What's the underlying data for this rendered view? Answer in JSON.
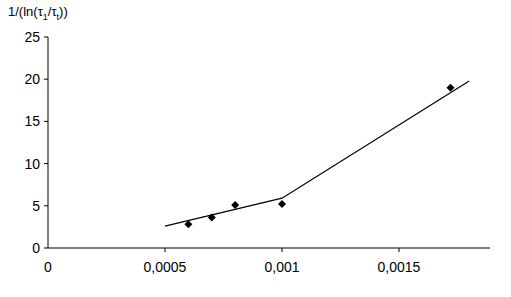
{
  "chart_data": {
    "type": "scatter",
    "title": "",
    "xlabel": "",
    "ylabel": "1/(ln(τ1/τt))",
    "ylabel_parts": {
      "prefix": "1/(ln(",
      "tau": "τ",
      "sub1": "1",
      "slash": "/",
      "sub2": "t",
      "suffix": "))"
    },
    "xlim": [
      0,
      0.00189
    ],
    "ylim": [
      0,
      25
    ],
    "x_ticks": [
      0,
      0.0005,
      0.001,
      0.0015
    ],
    "x_tick_labels": [
      "0",
      "0,0005",
      "0,001",
      "0,0015"
    ],
    "y_ticks": [
      0,
      5,
      10,
      15,
      20,
      25
    ],
    "y_tick_labels": [
      "0",
      "5",
      "10",
      "15",
      "20",
      "25"
    ],
    "grid": false,
    "legend": null,
    "series": [
      {
        "name": "data points",
        "marker": "diamond",
        "color": "#000000",
        "x": [
          0.0006,
          0.0007,
          0.0008,
          0.001,
          0.00172
        ],
        "y": [
          2.8,
          3.6,
          5.1,
          5.2,
          19.0
        ]
      },
      {
        "name": "fit line",
        "style": "line",
        "color": "#000000",
        "x": [
          0.0005,
          0.001,
          0.0018
        ],
        "y": [
          2.6,
          5.9,
          19.8
        ]
      }
    ]
  }
}
